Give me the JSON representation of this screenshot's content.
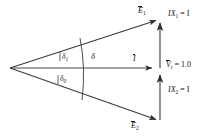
{
  "figure": {
    "kind": "phasor-vector-diagram",
    "background_color": "#ffffff",
    "line_color": "#3a3a3a",
    "text_color": "#111111",
    "width": 218,
    "height": 139
  },
  "vectors": {
    "e1": {
      "symbol": "E",
      "subscript": "1",
      "overbar": true,
      "label": "E",
      "origin": [
        10,
        68
      ],
      "tip": [
        161,
        18
      ]
    },
    "current": {
      "symbol": "I",
      "subscript": "",
      "overbar": true,
      "label": "I",
      "origin": [
        10,
        68
      ],
      "tip": [
        157,
        68
      ]
    },
    "e2": {
      "symbol": "E",
      "subscript": "2",
      "overbar": true,
      "label": "E",
      "origin": [
        10,
        68
      ],
      "tip": [
        161,
        122
      ]
    }
  },
  "components": {
    "upper": {
      "label": "IX",
      "subscript": "1",
      "equals": "= I",
      "full": "IX1 = I",
      "from": [
        160,
        68
      ],
      "to": [
        160,
        20
      ]
    },
    "lower": {
      "label": "IX",
      "subscript": "2",
      "equals": "= I",
      "full": "IX2 = I",
      "from": [
        160,
        120
      ],
      "to": [
        160,
        72
      ]
    }
  },
  "terminal_voltage": {
    "symbol": "V",
    "subscript": "t",
    "overbar": true,
    "equals_sign": "=",
    "value": "1.0",
    "full": "Vt = 1.0"
  },
  "angles": {
    "delta_1": {
      "symbol": "δ",
      "subscript": "1",
      "position": "upper"
    },
    "delta_0": {
      "symbol": "δ",
      "subscript": "0",
      "position": "lower"
    },
    "delta": {
      "symbol": "δ",
      "subscript": "",
      "position": "arc"
    }
  },
  "arc": {
    "description": "locus arc crossing the three phasors",
    "x_at_axis": 88,
    "top": [
      80,
      38
    ],
    "bottom": [
      82,
      100
    ]
  }
}
